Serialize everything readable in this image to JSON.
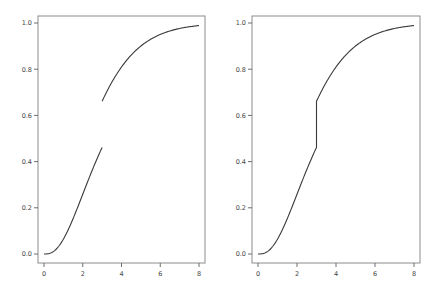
{
  "chart_data": [
    {
      "type": "line",
      "title": "",
      "xlabel": "",
      "ylabel": "",
      "xlim": [
        0,
        8
      ],
      "ylim": [
        0,
        1
      ],
      "xticks": [
        "0",
        "2",
        "4",
        "6",
        "8"
      ],
      "yticks": [
        "0.0",
        "0.2",
        "0.4",
        "0.6",
        "0.8",
        "1.0"
      ],
      "grid": false,
      "legend": "none",
      "description": "CDF with jump at x=3 drawn as two disconnected segments",
      "discontinuity_x": 3,
      "connect_jump": false,
      "series": [
        {
          "name": "F(x)",
          "x": [
            0,
            0.5,
            1,
            1.5,
            2,
            2.5,
            3,
            3,
            3.5,
            4,
            4.5,
            5,
            5.5,
            6,
            6.5,
            7,
            7.5,
            8
          ],
          "y": [
            0.0,
            0.011,
            0.064,
            0.153,
            0.259,
            0.365,
            0.46,
            0.66,
            0.734,
            0.795,
            0.845,
            0.885,
            0.916,
            0.942,
            0.959,
            0.971,
            0.981,
            0.989
          ]
        }
      ]
    },
    {
      "type": "line",
      "title": "",
      "xlabel": "",
      "ylabel": "",
      "xlim": [
        0,
        8
      ],
      "ylim": [
        0,
        1
      ],
      "xticks": [
        "0",
        "2",
        "4",
        "6",
        "8"
      ],
      "yticks": [
        "0.0",
        "0.2",
        "0.4",
        "0.6",
        "0.8",
        "1.0"
      ],
      "grid": false,
      "legend": "none",
      "description": "Same CDF with jump at x=3 drawn as a vertical connecting segment",
      "discontinuity_x": 3,
      "connect_jump": true,
      "series": [
        {
          "name": "F(x)",
          "x": [
            0,
            0.5,
            1,
            1.5,
            2,
            2.5,
            3,
            3,
            3.5,
            4,
            4.5,
            5,
            5.5,
            6,
            6.5,
            7,
            7.5,
            8
          ],
          "y": [
            0.0,
            0.011,
            0.064,
            0.153,
            0.259,
            0.365,
            0.46,
            0.66,
            0.734,
            0.795,
            0.845,
            0.885,
            0.916,
            0.942,
            0.959,
            0.971,
            0.981,
            0.989
          ]
        }
      ]
    }
  ]
}
